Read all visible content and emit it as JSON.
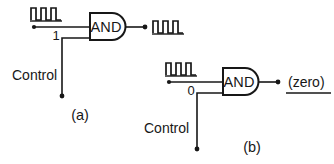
{
  "figure": {
    "background_color": "#ffffff",
    "line_color": "#171717"
  },
  "panel_a": {
    "id": "(a)",
    "gate_label": "AND",
    "gate_type": "and-gate",
    "input_signal": {
      "name": "clock-pulse-train",
      "kind": "square-wave",
      "pulse_count": 3,
      "has_terminal_dot": true
    },
    "control_value": "1",
    "control_label": "Control",
    "control_line": {
      "direction": "down",
      "has_terminal_dot": true
    },
    "output_signal": {
      "name": "clock-pulse-train",
      "kind": "square-wave",
      "pulse_count": 3,
      "has_terminal_dot": true
    },
    "behavior": "pulses pass through"
  },
  "panel_b": {
    "id": "(b)",
    "gate_label": "AND",
    "gate_type": "and-gate",
    "input_signal": {
      "name": "clock-pulse-train",
      "kind": "square-wave",
      "pulse_count": 3,
      "has_terminal_dot": true
    },
    "control_value": "0",
    "control_label": "Control",
    "control_line": {
      "direction": "down",
      "has_terminal_dot": true
    },
    "output_signal": {
      "name": "zero-level",
      "kind": "flat-line",
      "text": "(zero)",
      "has_terminal_dot": true
    },
    "behavior": "pulses blocked"
  }
}
